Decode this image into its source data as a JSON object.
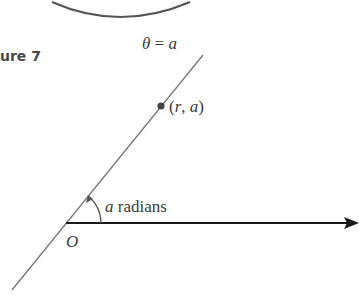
{
  "figure": {
    "caption": "ure 7",
    "line_label": {
      "theta": "θ",
      "equals": " = ",
      "value": "a"
    },
    "point_label": {
      "open": "(",
      "r": "r",
      "sep": ", ",
      "a": "a",
      "close": ")"
    },
    "angle_label": {
      "var": "a",
      "unit": " radians"
    },
    "origin_label": "O"
  },
  "colors": {
    "axis": "#1a1a1a",
    "line": "#777777",
    "circle": "#555555",
    "point": "#444444",
    "text": "#3a3a3a"
  }
}
